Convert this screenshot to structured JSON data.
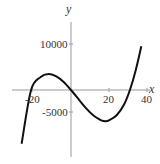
{
  "chart_data": {
    "type": "line",
    "title": "",
    "xlabel": "x",
    "ylabel": "y",
    "xlim": [
      -27,
      40
    ],
    "ylim": [
      -13000,
      16000
    ],
    "x_ticks": [
      -20,
      20,
      40
    ],
    "x_tick_labels": [
      "-20",
      "20",
      "40"
    ],
    "y_ticks": [
      10000,
      -5000
    ],
    "y_tick_labels": [
      "10000",
      "-5000"
    ],
    "grid": false,
    "legend": null,
    "series": [
      {
        "name": "cubic",
        "description": "y = 0.75 x (x + 21)(x - 31)",
        "roots": [
          -21,
          0,
          31
        ],
        "local_max": {
          "x": -12,
          "y": 3500
        },
        "local_min": {
          "x": 18,
          "y": -6800
        },
        "x": [
          -26,
          -21,
          -16,
          -12,
          -8,
          -4,
          0,
          4,
          8,
          12,
          16,
          18,
          20,
          24,
          28,
          31,
          34,
          37
        ],
        "y": [
          -11700,
          0,
          2800,
          3480,
          3000,
          1800,
          0,
          -2000,
          -4000,
          -5600,
          -6600,
          -6800,
          -6600,
          -5500,
          -3100,
          0,
          4200,
          9500
        ]
      }
    ]
  },
  "axes": {
    "x_label": "x",
    "y_label": "y",
    "x_ticks": [
      "-20",
      "20",
      "40"
    ],
    "y_ticks": [
      "10000",
      "-5000"
    ]
  }
}
